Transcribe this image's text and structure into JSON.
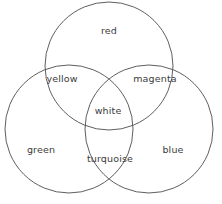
{
  "diagram": {
    "type": "venn-3-set",
    "stroke_color": "#4c4c4c",
    "text_color": "#3b3b3b",
    "background_color": "#ffffff",
    "canvas": {
      "width": 222,
      "height": 204
    },
    "circles": [
      {
        "id": "red",
        "label": "red",
        "cx": 109,
        "cy": 66,
        "r": 64
      },
      {
        "id": "green",
        "label": "green",
        "cx": 69,
        "cy": 129,
        "r": 64
      },
      {
        "id": "blue",
        "label": "blue",
        "cx": 149,
        "cy": 129,
        "r": 64
      }
    ],
    "labels": [
      {
        "id": "red",
        "text": "red",
        "x": 109,
        "y": 31,
        "sets": [
          "red"
        ]
      },
      {
        "id": "yellow",
        "text": "yellow",
        "x": 62,
        "y": 79,
        "sets": [
          "red",
          "green"
        ]
      },
      {
        "id": "magenta",
        "text": "magenta",
        "x": 155,
        "y": 79,
        "sets": [
          "red",
          "blue"
        ]
      },
      {
        "id": "white",
        "text": "white",
        "x": 108,
        "y": 111,
        "sets": [
          "red",
          "green",
          "blue"
        ]
      },
      {
        "id": "green",
        "text": "green",
        "x": 41,
        "y": 150,
        "sets": [
          "green"
        ]
      },
      {
        "id": "blue",
        "text": "blue",
        "x": 173,
        "y": 150,
        "sets": [
          "blue"
        ]
      },
      {
        "id": "turquoise",
        "text": "turquoise",
        "x": 110,
        "y": 159,
        "sets": [
          "green",
          "blue"
        ]
      }
    ]
  }
}
